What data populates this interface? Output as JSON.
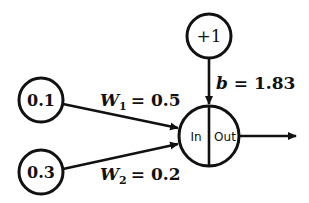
{
  "diagram": {
    "type": "single-neuron",
    "inputs": [
      {
        "value": "0.1",
        "weight_symbol": "W",
        "weight_index": "1",
        "weight_eq": "= 0.5"
      },
      {
        "value": "0.3",
        "weight_symbol": "W",
        "weight_index": "2",
        "weight_eq": "= 0.2"
      }
    ],
    "bias": {
      "node": "+1",
      "label_symbol": "b",
      "label_eq": "= 1.83"
    },
    "neuron": {
      "in_label": "In",
      "out_label": "Out"
    },
    "colors": {
      "stroke": "#111111",
      "background": "#ffffff"
    }
  }
}
